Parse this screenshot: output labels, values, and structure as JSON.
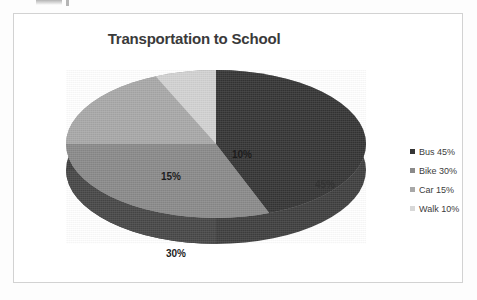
{
  "chart_data": {
    "type": "pie",
    "title": "Transportation to School",
    "categories": [
      "Bus",
      "Bike",
      "Car",
      "Walk"
    ],
    "values": [
      45,
      30,
      15,
      10
    ],
    "data_labels": [
      "45%",
      "30%",
      "15%",
      "10%"
    ],
    "legend_entries": [
      "Bus 45%",
      "Bike 30%",
      "Car 15%",
      "Walk 10%"
    ],
    "colors": [
      "#353535",
      "#8a8a8a",
      "#a8a8a8",
      "#d2d2d2"
    ],
    "legend_position": "right",
    "three_d": true,
    "grid": false,
    "xlabel": "",
    "ylabel": ""
  },
  "chart": {
    "title": "Transportation to School",
    "labels": {
      "bus": "45%",
      "bike": "30%",
      "car": "15%",
      "walk": "10%"
    }
  },
  "legend": {
    "items": [
      {
        "label": "Bus 45%",
        "color": "#353535"
      },
      {
        "label": "Bike 30%",
        "color": "#8a8a8a"
      },
      {
        "label": "Car 15%",
        "color": "#a8a8a8"
      },
      {
        "label": "Walk 10%",
        "color": "#d8d8d8"
      }
    ]
  }
}
